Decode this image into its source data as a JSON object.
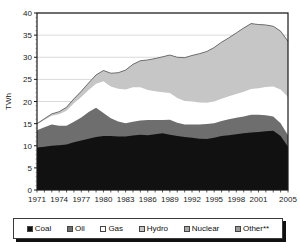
{
  "chart_data": {
    "type": "area",
    "stacked": true,
    "title": "",
    "xlabel": "",
    "ylabel": "TWh",
    "ylim": [
      0,
      40
    ],
    "ytick_step": 5,
    "yticks": [
      "0",
      "5",
      "10",
      "15",
      "20",
      "25",
      "30",
      "35",
      "40"
    ],
    "grid": true,
    "legend_position": "bottom",
    "x_start": 1971,
    "x_end": 2005,
    "x": [
      1971,
      1972,
      1973,
      1974,
      1975,
      1976,
      1977,
      1978,
      1979,
      1980,
      1981,
      1982,
      1983,
      1984,
      1985,
      1986,
      1987,
      1988,
      1989,
      1990,
      1991,
      1992,
      1993,
      1994,
      1995,
      1996,
      1997,
      1998,
      1999,
      2000,
      2001,
      2002,
      2003,
      2004,
      2005
    ],
    "xticks": [
      "1971",
      "1974",
      "1977",
      "1980",
      "1983",
      "1986",
      "1989",
      "1992",
      "1995",
      "1998",
      "2001",
      "2005"
    ],
    "series": [
      {
        "name": "Coal",
        "color": "#111111",
        "values": [
          9.6,
          9.8,
          10.0,
          10.1,
          10.3,
          10.8,
          11.2,
          11.6,
          12.0,
          12.2,
          12.2,
          12.1,
          12.1,
          12.3,
          12.5,
          12.4,
          12.6,
          12.8,
          12.5,
          12.2,
          12.0,
          11.8,
          11.6,
          11.5,
          11.8,
          12.2,
          12.4,
          12.6,
          12.8,
          13.0,
          13.1,
          13.3,
          13.4,
          12.2,
          9.8
        ]
      },
      {
        "name": "Oil",
        "color": "#6e6e6e",
        "values": [
          3.9,
          4.4,
          4.8,
          4.4,
          4.2,
          4.6,
          5.2,
          6.0,
          6.6,
          5.2,
          4.0,
          3.4,
          3.0,
          3.1,
          3.2,
          3.4,
          3.2,
          3.0,
          3.4,
          3.0,
          2.8,
          3.0,
          3.2,
          3.4,
          3.3,
          3.4,
          3.6,
          3.7,
          3.8,
          4.0,
          3.9,
          3.6,
          3.2,
          2.9,
          2.6
        ]
      },
      {
        "name": "Gas",
        "color": "#ffffff",
        "values": [
          1.3,
          1.6,
          2.0,
          2.6,
          3.4,
          4.2,
          4.6,
          5.0,
          5.4,
          7.2,
          7.2,
          7.4,
          7.6,
          7.8,
          7.5,
          6.8,
          6.5,
          6.3,
          6.0,
          5.6,
          5.3,
          5.2,
          5.0,
          4.8,
          4.9,
          5.0,
          5.2,
          5.4,
          5.6,
          5.8,
          6.0,
          6.4,
          6.8,
          7.6,
          8.6
        ]
      },
      {
        "name": "Hydro",
        "color": "#c6c6c6",
        "values": [
          0.2,
          0.3,
          0.4,
          0.6,
          0.8,
          1.0,
          1.3,
          1.6,
          2.0,
          2.4,
          3.0,
          3.6,
          4.4,
          5.2,
          6.0,
          6.8,
          7.4,
          8.0,
          8.6,
          9.2,
          9.8,
          10.4,
          11.0,
          11.6,
          12.2,
          12.8,
          13.2,
          13.8,
          14.4,
          14.8,
          14.4,
          14.0,
          13.6,
          13.2,
          12.6
        ]
      },
      {
        "name": "Nuclear",
        "color": "#a8a8a8",
        "values": [
          0.0,
          0.0,
          0.0,
          0.0,
          0.0,
          0.0,
          0.0,
          0.0,
          0.0,
          0.0,
          0.0,
          0.0,
          0.0,
          0.0,
          0.0,
          0.0,
          0.0,
          0.0,
          0.0,
          0.0,
          0.0,
          0.0,
          0.0,
          0.0,
          0.0,
          0.0,
          0.0,
          0.0,
          0.0,
          0.0,
          0.0,
          0.0,
          0.0,
          0.0,
          0.0
        ]
      },
      {
        "name": "Other**",
        "color": "#9a9a9a",
        "values": [
          0.0,
          0.0,
          0.0,
          0.0,
          0.0,
          0.0,
          0.0,
          0.0,
          0.0,
          0.0,
          0.0,
          0.0,
          0.0,
          0.0,
          0.0,
          0.0,
          0.0,
          0.0,
          0.0,
          0.0,
          0.0,
          0.0,
          0.0,
          0.0,
          0.0,
          0.0,
          0.0,
          0.0,
          0.0,
          0.0,
          0.0,
          0.0,
          0.0,
          0.0,
          0.0
        ]
      }
    ],
    "totals": [
      15.0,
      16.1,
      17.2,
      17.7,
      18.7,
      20.6,
      22.3,
      24.2,
      26.0,
      27.0,
      26.4,
      26.5,
      27.1,
      28.4,
      29.2,
      29.4,
      29.7,
      30.1,
      30.5,
      30.0,
      29.9,
      30.4,
      30.8,
      31.3,
      32.2,
      33.4,
      34.4,
      35.5,
      36.6,
      37.6,
      37.4,
      37.3,
      37.0,
      35.9,
      33.6
    ],
    "legend": [
      {
        "label": "Coal",
        "color": "#111111"
      },
      {
        "label": "Oil",
        "color": "#6e6e6e"
      },
      {
        "label": "Gas",
        "color": "#ffffff"
      },
      {
        "label": "Hydro",
        "color": "#c6c6c6"
      },
      {
        "label": "Nuclear",
        "color": "#a8a8a8"
      },
      {
        "label": "Other**",
        "color": "#9a9a9a"
      }
    ]
  }
}
